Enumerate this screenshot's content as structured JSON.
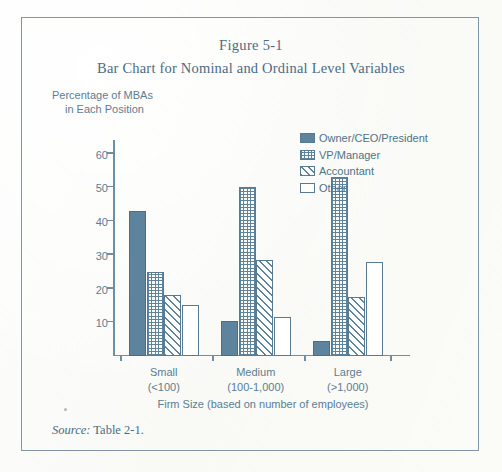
{
  "figure": {
    "number": "Figure 5-1",
    "subtitle": "Bar Chart for Nominal and Ordinal Level Variables",
    "source_prefix": "Source:",
    "source_text": "Table 2-1."
  },
  "colors": {
    "accent": "#5e839c",
    "stroke": "#567b93",
    "text": "#4f7389",
    "frame": "#7e96a8",
    "paper": "#fcfcfa"
  },
  "legend": {
    "position": "inside-top-right",
    "items": [
      {
        "label": "Owner/CEO/President",
        "pattern": "solid"
      },
      {
        "label": "VP/Manager",
        "pattern": "crosshatch-grid"
      },
      {
        "label": "Accountant",
        "pattern": "diagonal-hatch"
      },
      {
        "label": "Other",
        "pattern": "open"
      }
    ]
  },
  "yaxis": {
    "label_line1": "Percentage of MBAs",
    "label_line2": "in Each Position",
    "ticks": [
      10,
      20,
      30,
      40,
      50,
      60
    ],
    "tick_labels": [
      "10",
      "20",
      "30",
      "40",
      "50",
      "60"
    ],
    "min": 0,
    "max": 64
  },
  "xaxis": {
    "title": "Firm Size  (based on number of employees)",
    "groups": [
      {
        "name": "Small",
        "range": "(<100)"
      },
      {
        "name": "Medium",
        "range": "(100-1,000)"
      },
      {
        "name": "Large",
        "range": "(>1,000)"
      }
    ]
  },
  "chart_data": {
    "type": "bar",
    "title": "Bar Chart for Nominal and Ordinal Level Variables",
    "subtitle": "Figure 5-1",
    "xlabel": "Firm Size  (based on number of employees)",
    "ylabel": "Percentage of MBAs in Each Position",
    "categories": [
      "Small (<100)",
      "Medium (100-1,000)",
      "Large (>1,000)"
    ],
    "ylim": [
      0,
      64
    ],
    "yticks": [
      10,
      20,
      30,
      40,
      50,
      60
    ],
    "grid": false,
    "legend": "upper right",
    "series": [
      {
        "name": "Owner/CEO/President",
        "pattern": "solid",
        "values": [
          43.0,
          10.5,
          4.5
        ]
      },
      {
        "name": "VP/Manager",
        "pattern": "crosshatch-grid",
        "values": [
          25.0,
          50.0,
          53.0
        ]
      },
      {
        "name": "Accountant",
        "pattern": "diagonal-hatch",
        "values": [
          18.0,
          28.5,
          17.5
        ]
      },
      {
        "name": "Other",
        "pattern": "open",
        "values": [
          15.0,
          11.7,
          27.8
        ]
      }
    ],
    "source": "Source: Table 2-1."
  }
}
